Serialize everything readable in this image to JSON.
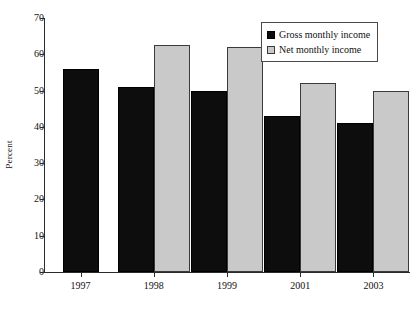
{
  "chart_data": {
    "type": "bar",
    "title": "",
    "xlabel": "",
    "ylabel": "Percent",
    "ylim": [
      0,
      70
    ],
    "yticks": [
      0,
      10,
      20,
      30,
      40,
      50,
      60,
      70
    ],
    "grid": false,
    "legend_position": "top-right",
    "categories": [
      "1997",
      "1998",
      "1999",
      "2001",
      "2003"
    ],
    "series": [
      {
        "name": "Gross monthly income",
        "color": "#0d0d0d",
        "values": [
          56,
          51,
          50,
          43,
          41
        ]
      },
      {
        "name": "Net monthly income",
        "color": "#c9c9c9",
        "values": [
          null,
          62.5,
          62,
          52,
          50
        ]
      }
    ]
  },
  "axis": {
    "y_title": "Percent",
    "y_tick_labels": [
      "0",
      "10",
      "20",
      "30",
      "40",
      "50",
      "60",
      "70"
    ],
    "x_tick_labels": [
      "1997",
      "1998",
      "1999",
      "2001",
      "2003"
    ]
  },
  "legend": {
    "items": [
      {
        "label": "Gross monthly income",
        "swatch": "black-square-icon"
      },
      {
        "label": "Net monthly income",
        "swatch": "gray-square-icon"
      }
    ]
  }
}
